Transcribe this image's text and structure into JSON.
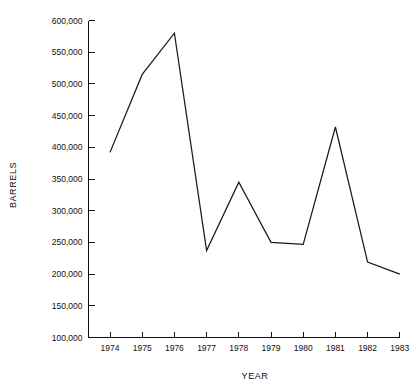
{
  "chart_data": {
    "type": "line",
    "title": "",
    "subtitle": "",
    "xlabel": "YEAR",
    "ylabel": "BARRELS",
    "x": [
      1974,
      1975,
      1976,
      1977,
      1978,
      1979,
      1980,
      1981,
      1982,
      1983
    ],
    "categories": [
      "1974",
      "1975",
      "1976",
      "1977",
      "1978",
      "1979",
      "1980",
      "1981",
      "1982",
      "1983"
    ],
    "values": [
      392000,
      515000,
      580000,
      237000,
      345000,
      250000,
      247000,
      432000,
      219000,
      200000
    ],
    "series": [
      {
        "name": "Barrels",
        "values": [
          392000,
          515000,
          580000,
          237000,
          345000,
          250000,
          247000,
          432000,
          219000,
          200000
        ],
        "color": "#1a1a1a"
      }
    ],
    "ylim": [
      100000,
      600000
    ],
    "xlim": [
      1974,
      1983
    ],
    "ytick_values": [
      100000,
      150000,
      200000,
      250000,
      300000,
      350000,
      400000,
      450000,
      500000,
      550000,
      600000
    ],
    "ytick_labels": [
      "100,000",
      "150,000",
      "200,000",
      "250,000",
      "300,000",
      "350,000",
      "400,000",
      "450,000",
      "500,000",
      "550,000",
      "600,000"
    ],
    "xtick_labels": [
      "1974",
      "1975",
      "1976",
      "1977",
      "1978",
      "1979",
      "1980",
      "1981",
      "1982",
      "1983"
    ],
    "grid": false,
    "legend": false,
    "legend_position": "none",
    "markers": false,
    "line_color": "#1a1a1a",
    "background_color": "#ffffff",
    "annotations": []
  }
}
